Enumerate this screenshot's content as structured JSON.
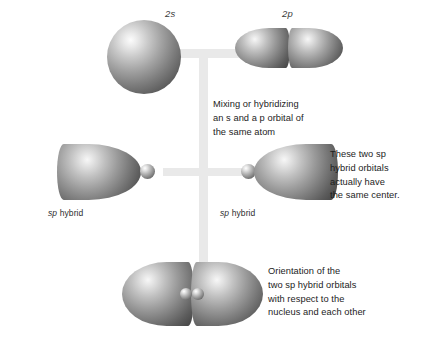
{
  "figure": {
    "title_labels": {
      "s_orbital": "2s",
      "p_orbital": "2p"
    },
    "hybrid_labels": {
      "left": "sp hybrid",
      "right": "sp hybrid",
      "left_italic": "sp",
      "left_rest": " hybrid",
      "right_italic": "sp",
      "right_rest": " hybrid"
    },
    "notes": {
      "mixing": "Mixing or hybridizing\nan s and a p orbital of\nthe same atom",
      "same_center": "These two sp\nhybrid orbitals\nactually have\nthe same center.",
      "orientation": "Orientation of the\ntwo sp hybrid orbitals\nwith respect to the\nnucleus and each other"
    },
    "colors": {
      "orbital_highlight": "#fcfcfc",
      "orbital_mid": "#9b9b9b",
      "orbital_edge": "#4a4a4a",
      "connector": "#e9e9e9",
      "background": "#ffffff",
      "text": "#1d1d1d"
    }
  }
}
